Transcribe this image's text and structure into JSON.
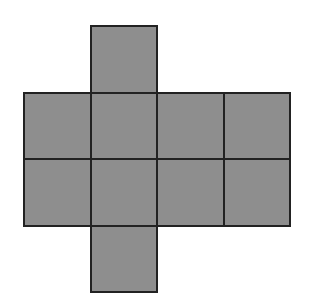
{
  "diagram": {
    "title": "",
    "type": "net of squares",
    "fill_color": "#8e8e8e",
    "border_color": "#222222",
    "background_color": "#ffffff",
    "grid": {
      "origin_x": 24,
      "origin_y": 26,
      "cell_size": 66.6,
      "columns": 4,
      "rows": 4
    },
    "cells": [
      {
        "row": 0,
        "col": 1
      },
      {
        "row": 1,
        "col": 0
      },
      {
        "row": 1,
        "col": 1
      },
      {
        "row": 1,
        "col": 2
      },
      {
        "row": 1,
        "col": 3
      },
      {
        "row": 2,
        "col": 0
      },
      {
        "row": 2,
        "col": 1
      },
      {
        "row": 2,
        "col": 2
      },
      {
        "row": 2,
        "col": 3
      },
      {
        "row": 3,
        "col": 1
      }
    ],
    "cell_count": 10
  }
}
